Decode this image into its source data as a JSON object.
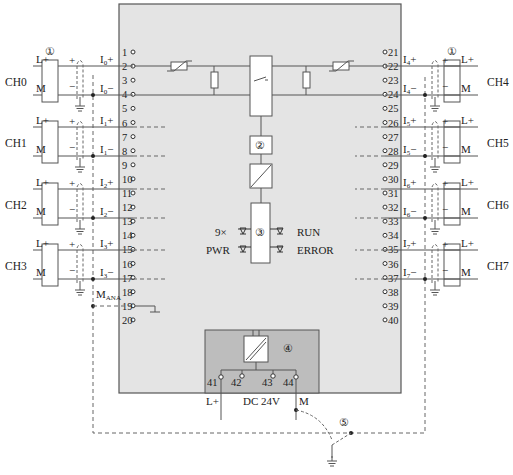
{
  "figure": {
    "type": "wiring-diagram",
    "colors": {
      "module_fill": "#e4e4e4",
      "power_block_fill": "#bdbdbd",
      "line": "#555555",
      "text": "#222222"
    }
  },
  "left_channels": [
    {
      "name": "CH0",
      "plus": "I0+",
      "minus": "I0−",
      "pin_plus": "1",
      "pin_minus": "3",
      "plus_sub": "0",
      "minus_sub": "0"
    },
    {
      "name": "CH1",
      "plus": "I1+",
      "minus": "I1−",
      "pin_plus": "6",
      "pin_minus": "7",
      "plus_sub": "1",
      "minus_sub": "1"
    },
    {
      "name": "CH2",
      "plus": "I2+",
      "minus": "I2−",
      "pin_plus": "10",
      "pin_minus": "12",
      "plus_sub": "2",
      "minus_sub": "2"
    },
    {
      "name": "CH3",
      "plus": "I3+",
      "minus": "I3−",
      "pin_plus": "14",
      "pin_minus": "16",
      "plus_sub": "3",
      "minus_sub": "3"
    }
  ],
  "right_channels": [
    {
      "name": "CH4",
      "plus": "I4+",
      "minus": "I4−",
      "pin_plus": "21",
      "pin_minus": "23",
      "plus_sub": "4",
      "minus_sub": "4"
    },
    {
      "name": "CH5",
      "plus": "I5+",
      "minus": "I5−",
      "pin_plus": "25",
      "pin_minus": "27",
      "plus_sub": "5",
      "minus_sub": "5"
    },
    {
      "name": "CH6",
      "plus": "I6+",
      "minus": "I6−",
      "pin_plus": "30",
      "pin_minus": "32",
      "plus_sub": "6",
      "minus_sub": "6"
    },
    {
      "name": "CH7",
      "plus": "I7+",
      "minus": "I7−",
      "pin_plus": "34",
      "pin_minus": "36",
      "plus_sub": "7",
      "minus_sub": "7"
    }
  ],
  "left_pins": [
    "1",
    "2",
    "3",
    "4",
    "5",
    "6",
    "7",
    "8",
    "9",
    "10",
    "11",
    "12",
    "13",
    "14",
    "15",
    "16",
    "17",
    "18",
    "19",
    "20"
  ],
  "right_pins": [
    "21",
    "22",
    "23",
    "24",
    "25",
    "26",
    "27",
    "28",
    "29",
    "30",
    "31",
    "32",
    "33",
    "34",
    "35",
    "36",
    "37",
    "38",
    "39",
    "40"
  ],
  "labels": {
    "sensor_lplus": "L+",
    "sensor_m": "M",
    "plus_sign": "+",
    "minus_sign": "−",
    "callout_1": "①",
    "callout_2": "②",
    "callout_3": "③",
    "callout_4": "④",
    "callout_5": "⑤",
    "mana_main": "M",
    "mana_sub": "ANA",
    "i_letter": "I"
  },
  "leds": {
    "left_top": "9×",
    "left_bottom": "PWR",
    "right_top": "RUN",
    "right_bottom": "ERROR"
  },
  "power_supply": {
    "pins": [
      "41",
      "42",
      "43",
      "44"
    ],
    "lplus": "L+",
    "voltage": "DC 24V",
    "m": "M"
  }
}
